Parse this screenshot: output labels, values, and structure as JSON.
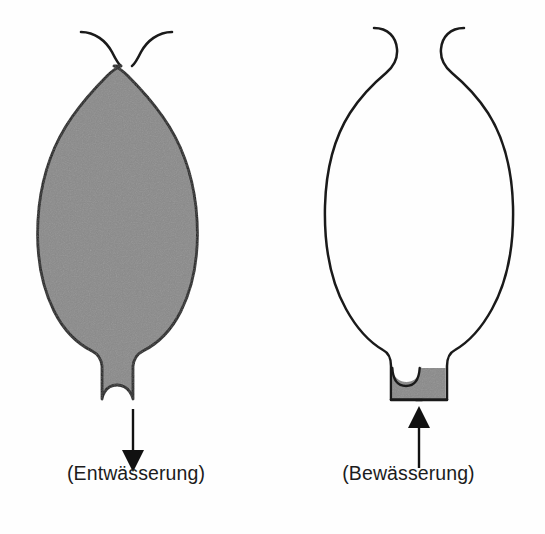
{
  "figure": {
    "type": "diagram",
    "background_color": "#fefefe",
    "outline_color": "#1a1a1a",
    "fill_color": "#8a8a8a",
    "panels": [
      {
        "id": "left",
        "caption": "(Entwässerung)",
        "state": "filled",
        "body_fill": "#8a8a8a",
        "neck_fill": "#8a8a8a",
        "arrow": {
          "name": "down-arrow",
          "direction": "down",
          "color": "#111111",
          "x": 133,
          "y_start": 409,
          "y_end": 470
        },
        "horns": 2
      },
      {
        "id": "right",
        "caption": "(Bewässerung)",
        "state": "empty",
        "body_fill": "none",
        "neck_fill": "#8a8a8a",
        "arrow": {
          "name": "up-arrow",
          "direction": "up",
          "color": "#111111",
          "x": 419,
          "y_start": 468,
          "y_end": 408
        },
        "horns": 2
      }
    ]
  },
  "labels": {
    "left_caption": "(Entwässerung)",
    "right_caption": "(Bewässerung)"
  }
}
